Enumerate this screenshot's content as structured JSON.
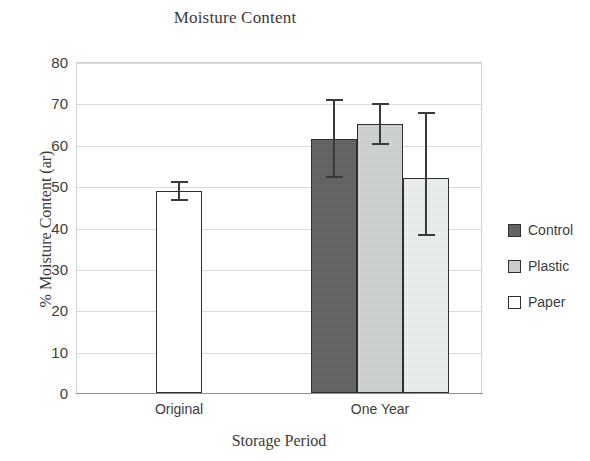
{
  "chart_data": {
    "type": "bar",
    "title": "Moisture Content",
    "xlabel": "Storage Period",
    "ylabel": "% Moisture Content (ar)",
    "categories": [
      "Original",
      "One Year"
    ],
    "ylim": [
      0,
      80
    ],
    "ytick_step": 10,
    "yticks": [
      "80",
      "70",
      "60",
      "50",
      "40",
      "30",
      "20",
      "10",
      "0"
    ],
    "grid": true,
    "legend_position": "right",
    "series": [
      {
        "name": "Control",
        "color": "#636363",
        "values": [
          null,
          61.5
        ],
        "errors": [
          null,
          9.5
        ]
      },
      {
        "name": "Plastic",
        "color": "#d3d6d6",
        "values": [
          null,
          65.0
        ],
        "errors": [
          null,
          5.0
        ]
      },
      {
        "name": "Paper",
        "color": "#eef3f4",
        "values": [
          48.8,
          52.0
        ],
        "errors": [
          2.5,
          14.0
        ]
      }
    ],
    "bars": [
      {
        "id": "original-paper",
        "group": "Original",
        "series": "Paper",
        "value": 48.8,
        "err_low": 46.3,
        "err_high": 51.3,
        "fill": "white"
      },
      {
        "id": "oneyear-control",
        "group": "One Year",
        "series": "Control",
        "value": 61.5,
        "err_low": 52.0,
        "err_high": 71.0,
        "fill": "control"
      },
      {
        "id": "oneyear-plastic",
        "group": "One Year",
        "series": "Plastic",
        "value": 65.0,
        "err_low": 60.0,
        "err_high": 70.0,
        "fill": "plastic"
      },
      {
        "id": "oneyear-paper",
        "group": "One Year",
        "series": "Paper",
        "value": 52.0,
        "err_low": 38.0,
        "err_high": 68.0,
        "fill": "paper"
      }
    ]
  },
  "legend": {
    "items": [
      {
        "label": "Control",
        "swatch": "control"
      },
      {
        "label": "Plastic",
        "swatch": "plastic"
      },
      {
        "label": "Paper",
        "swatch": "paper"
      }
    ]
  }
}
